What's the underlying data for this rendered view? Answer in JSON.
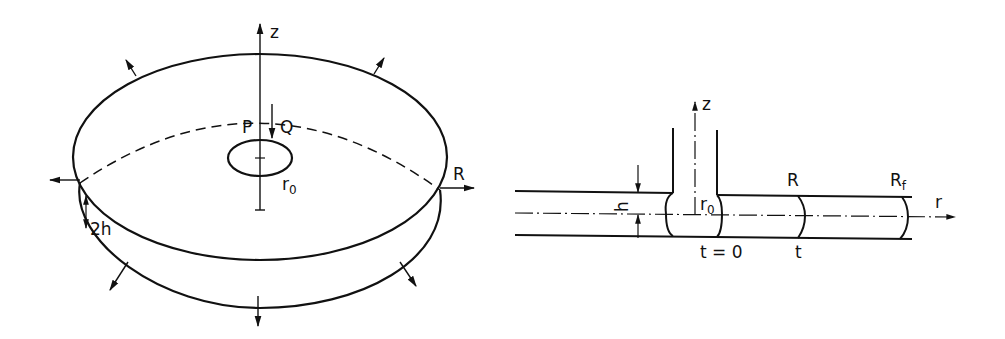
{
  "figure": {
    "left_panel": {
      "description": "Radial flow between parallel disks (3D view)",
      "labels": {
        "z_axis": "z",
        "pressure": "P",
        "flow_rate": "Q",
        "inlet_radius_main": "r",
        "inlet_radius_sub": "0",
        "radius": "R",
        "gap": "2h"
      }
    },
    "right_panel": {
      "description": "Cross-section of radial flow front advancing from inlet",
      "labels": {
        "z_axis": "z",
        "half_gap": "h",
        "inlet_radius_main": "r",
        "inlet_radius_sub": "0",
        "front_radius": "R",
        "final_radius_main": "R",
        "final_radius_sub": "f",
        "r_axis": "r",
        "time_zero": "t = 0",
        "time": "t"
      }
    },
    "colors": {
      "stroke": "#111111",
      "background": "#ffffff"
    }
  }
}
